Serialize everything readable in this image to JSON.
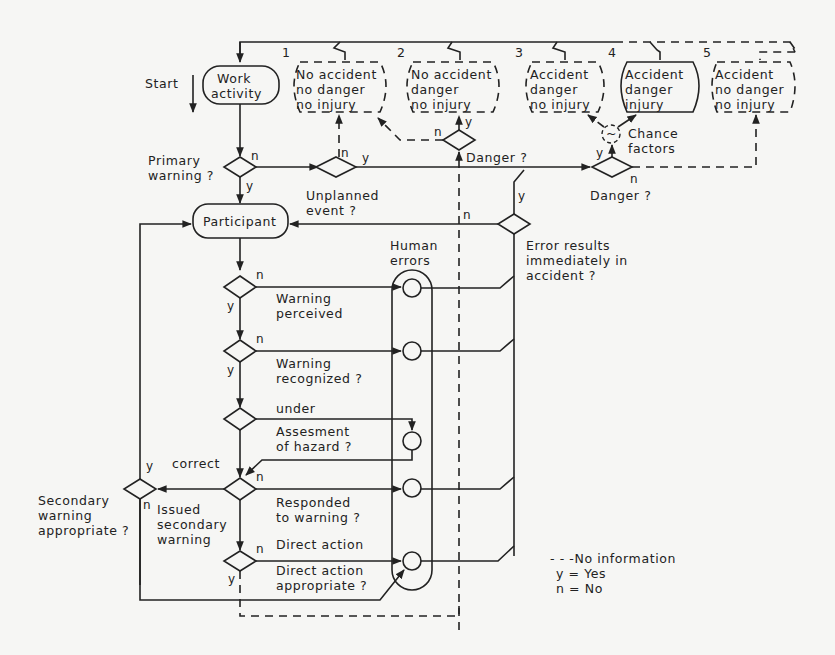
{
  "outcomes": [
    {
      "num": "1",
      "lines": [
        "No accident",
        "no danger",
        "no injury"
      ],
      "dashed": true
    },
    {
      "num": "2",
      "lines": [
        "No accident",
        "danger",
        "no injury"
      ],
      "dashed": true
    },
    {
      "num": "3",
      "lines": [
        "Accident",
        "danger",
        "no injury"
      ],
      "dashed": true
    },
    {
      "num": "4",
      "lines": [
        "Accident",
        "danger",
        "injury"
      ],
      "dashed": false
    },
    {
      "num": "5",
      "lines": [
        "Accident",
        "no danger",
        "no injury"
      ],
      "dashed": true
    }
  ],
  "start": {
    "label": "Start",
    "node": [
      "Work",
      "activity"
    ]
  },
  "participant": "Participant",
  "decisions": {
    "primary_warning": [
      "Primary",
      "warning ?"
    ],
    "unplanned_event": [
      "Unplanned",
      "event ?"
    ],
    "danger_top": "Danger ?",
    "danger_right": "Danger ?",
    "chance_factors": [
      "Chance",
      "factors"
    ],
    "error_results": [
      "Error results",
      "immediately in",
      "accident ?"
    ],
    "warning_perceived": [
      "Warning",
      "perceived"
    ],
    "warning_recognized": [
      "Warning",
      "recognized ?"
    ],
    "under": "under",
    "assessment": [
      "Assesment",
      "of hazard ?"
    ],
    "correct": "correct",
    "responded": [
      "Responded",
      "to warning ?"
    ],
    "direct_action": "Direct action",
    "direct_action_appropriate": [
      "Direct action",
      "appropriate ?"
    ],
    "secondary_warning": [
      "Secondary",
      "warning",
      "appropriate ?"
    ],
    "issued_secondary": [
      "Issued",
      "secondary",
      "warning"
    ]
  },
  "human_errors": [
    "Human",
    "errors"
  ],
  "branch": {
    "yes": "y",
    "no": "n"
  },
  "legend": {
    "dashed": "- - -No information",
    "y": "y  =  Yes",
    "n": "n  =  No"
  }
}
